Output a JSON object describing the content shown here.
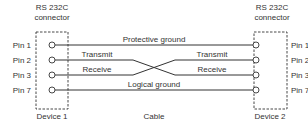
{
  "diagram": {
    "left_connector": {
      "label_line1": "RS 232C",
      "label_line2": "connector",
      "device_label": "Device 1",
      "pins": [
        "Pin 1",
        "Pin 2",
        "Pin 3",
        "Pin 7"
      ]
    },
    "right_connector": {
      "label_line1": "RS 232C",
      "label_line2": "connector",
      "device_label": "Device 2",
      "pins": [
        "Pin 1",
        "Pin 2",
        "Pin 3",
        "Pin 7"
      ]
    },
    "cable_label": "Cable",
    "signals": {
      "protective_ground": "Protective ground",
      "left_transmit": "Transmit",
      "left_receive": "Receive",
      "right_transmit": "Transmit",
      "right_receive": "Receive",
      "logical_ground": "Logical ground"
    },
    "connections": [
      {
        "from": "Device 1 Pin 1",
        "to": "Device 2 Pin 1",
        "signal": "Protective ground"
      },
      {
        "from": "Device 1 Pin 2",
        "to": "Device 2 Pin 3",
        "signal": "Transmit -> Receive"
      },
      {
        "from": "Device 1 Pin 3",
        "to": "Device 2 Pin 2",
        "signal": "Receive <- Transmit"
      },
      {
        "from": "Device 1 Pin 7",
        "to": "Device 2 Pin 7",
        "signal": "Logical ground"
      }
    ],
    "colors": {
      "line": "#333333",
      "background": "#ffffff"
    }
  }
}
